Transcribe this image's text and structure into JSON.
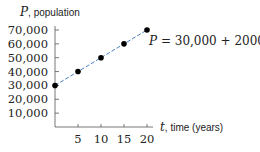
{
  "chart_data": {
    "type": "line",
    "title": "",
    "xlabel_var": "t",
    "xlabel_text": ", time (years)",
    "ylabel_var": "P",
    "ylabel_text": ", population",
    "x": [
      0,
      5,
      10,
      15,
      20
    ],
    "series": [
      {
        "name": "P = 30,000 + 2000t",
        "values": [
          30000,
          40000,
          50000,
          60000,
          70000
        ],
        "color": "#4a7fc1",
        "line_style": "dashed",
        "marker": "filled-circle",
        "marker_color": "#000000"
      }
    ],
    "x_ticks": [
      5,
      10,
      15,
      20
    ],
    "x_tick_labels": [
      "5",
      "10",
      "15",
      "20"
    ],
    "y_ticks": [
      10000,
      20000,
      30000,
      40000,
      50000,
      60000,
      70000
    ],
    "y_tick_labels": [
      "10,000",
      "20,000",
      "30,000",
      "40,000",
      "50,000",
      "60,000",
      "70,000"
    ],
    "xlim": [
      0,
      21
    ],
    "ylim": [
      0,
      72000
    ],
    "grid": false,
    "annotations": [
      {
        "text": "P = 30,000 + 2000t",
        "near_point": [
          20,
          70000
        ]
      }
    ]
  },
  "labels": {
    "y_var": "P",
    "y_text": ", population",
    "x_var": "t",
    "x_text": ", time (years)",
    "eq_P": "P",
    "eq_rest": " = 30,000 + 2000",
    "eq_t": "t"
  }
}
